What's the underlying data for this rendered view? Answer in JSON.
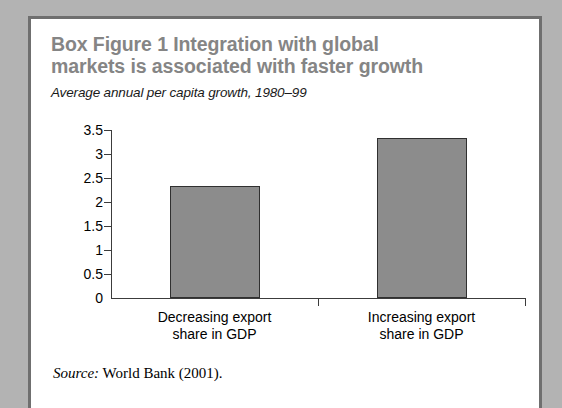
{
  "figure": {
    "title": "Box Figure 1  Integration with global\nmarkets is associated with faster growth",
    "subtitle": "Average annual per capita growth, 1980–99",
    "source_label": "Source:",
    "source_text": " World Bank (2001).",
    "colors": {
      "page_background": "#b3b3b3",
      "panel_background": "#ffffff",
      "panel_border": "#6f6f6f",
      "title_text": "#858585",
      "bar_fill": "#8c8c8c",
      "bar_outline": "#303030",
      "axis_line": "#3c3c3c",
      "tick_text": "#000000"
    }
  },
  "chart_data": {
    "type": "bar",
    "title": "Box Figure 1  Integration with global markets is associated with faster growth",
    "subtitle": "Average annual per capita growth, 1980–99",
    "xlabel": "",
    "ylabel": "",
    "ylim": [
      0,
      3.5
    ],
    "yticks": [
      0,
      0.5,
      1,
      1.5,
      2,
      2.5,
      3,
      3.5
    ],
    "ytick_labels": [
      "0",
      "0.5",
      "1",
      "1.5",
      "2",
      "2.5",
      "3",
      "3.5"
    ],
    "grid": false,
    "legend": false,
    "categories": [
      "Decreasing export\nshare in GDP",
      "Increasing export\nshare in GDP"
    ],
    "values": [
      2.33,
      3.33
    ],
    "series": [
      {
        "name": "Average annual per capita growth, 1980-99",
        "values": [
          2.33,
          3.33
        ]
      }
    ]
  }
}
